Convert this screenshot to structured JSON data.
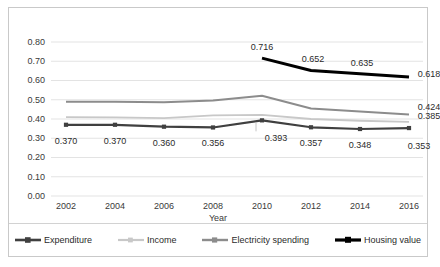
{
  "chart_data": {
    "type": "line",
    "title": "",
    "xlabel": "Year",
    "ylabel": "",
    "categories": [
      "2002",
      "2004",
      "2006",
      "2008",
      "2010",
      "2012",
      "2014",
      "2016"
    ],
    "x": [
      2002,
      2004,
      2006,
      2008,
      2010,
      2012,
      2014,
      2016
    ],
    "ylim": [
      0.0,
      0.8
    ],
    "yticks": [
      "0.00",
      "0.10",
      "0.20",
      "0.30",
      "0.40",
      "0.50",
      "0.60",
      "0.70",
      "0.80"
    ],
    "ytick_values": [
      0.0,
      0.1,
      0.2,
      0.3,
      0.4,
      0.5,
      0.6,
      0.7,
      0.8
    ],
    "grid": "horizontal",
    "legend_position": "bottom",
    "series": [
      {
        "name": "Expenditure",
        "color": "#404040",
        "marker": "square",
        "width": 2.2,
        "values": [
          0.37,
          0.37,
          0.36,
          0.356,
          0.393,
          0.357,
          0.348,
          0.353
        ],
        "labels": [
          "0.370",
          "0.370",
          "0.360",
          "0.356",
          "0.393",
          "0.357",
          "0.348",
          "0.353"
        ]
      },
      {
        "name": "Income",
        "color": "#c8c8c8",
        "marker": "none",
        "width": 1.8,
        "values": [
          0.41,
          0.408,
          0.405,
          0.419,
          0.421,
          0.4,
          0.391,
          0.385
        ],
        "labels": [
          "",
          "",
          "",
          "",
          "",
          "",
          "",
          "0.385"
        ]
      },
      {
        "name": "Electricity spending",
        "color": "#8c8c8c",
        "marker": "none",
        "width": 2.0,
        "values": [
          0.49,
          0.489,
          0.487,
          0.496,
          0.521,
          0.455,
          0.439,
          0.424
        ],
        "labels": [
          "",
          "",
          "",
          "",
          "",
          "",
          "",
          "0.424"
        ]
      },
      {
        "name": "Housing value",
        "color": "#000000",
        "marker": "none",
        "width": 3.0,
        "values": [
          null,
          null,
          null,
          null,
          0.716,
          0.652,
          0.635,
          0.618
        ],
        "labels": [
          "",
          "",
          "",
          "",
          "0.716",
          "0.652",
          "0.635",
          "0.618"
        ]
      }
    ],
    "annotations": [
      {
        "text": "0.370",
        "series": "Expenditure",
        "x": 2002,
        "y": 0.37
      },
      {
        "text": "0.370",
        "series": "Expenditure",
        "x": 2004,
        "y": 0.37
      },
      {
        "text": "0.360",
        "series": "Expenditure",
        "x": 2006,
        "y": 0.36
      },
      {
        "text": "0.356",
        "series": "Expenditure",
        "x": 2008,
        "y": 0.356
      },
      {
        "text": "0.393",
        "series": "Expenditure",
        "x": 2010,
        "y": 0.393
      },
      {
        "text": "0.357",
        "series": "Expenditure",
        "x": 2012,
        "y": 0.357
      },
      {
        "text": "0.348",
        "series": "Expenditure",
        "x": 2014,
        "y": 0.348
      },
      {
        "text": "0.353",
        "series": "Expenditure",
        "x": 2016,
        "y": 0.353
      },
      {
        "text": "0.716",
        "series": "Housing value",
        "x": 2010,
        "y": 0.716
      },
      {
        "text": "0.652",
        "series": "Housing value",
        "x": 2012,
        "y": 0.652
      },
      {
        "text": "0.635",
        "series": "Housing value",
        "x": 2014,
        "y": 0.635
      },
      {
        "text": "0.618",
        "series": "Housing value",
        "x": 2016,
        "y": 0.618
      },
      {
        "text": "0.424",
        "series": "Electricity spending",
        "x": 2016,
        "y": 0.424
      },
      {
        "text": "0.385",
        "series": "Income",
        "x": 2016,
        "y": 0.385
      }
    ]
  },
  "labels": {
    "yticks": [
      "0.80",
      "0.70",
      "0.60",
      "0.50",
      "0.40",
      "0.30",
      "0.20",
      "0.10",
      "0.00"
    ],
    "xticks": [
      "2002",
      "2004",
      "2006",
      "2008",
      "2010",
      "2012",
      "2014",
      "2016"
    ],
    "xaxis_title": "Year",
    "legend": [
      "Expenditure",
      "Income",
      "Electricity spending",
      "Housing value"
    ],
    "data_labels": {
      "expenditure": [
        "0.370",
        "0.370",
        "0.360",
        "0.356",
        "0.393",
        "0.357",
        "0.348",
        "0.353"
      ],
      "housing_value": [
        "0.716",
        "0.652",
        "0.635",
        "0.618"
      ],
      "electricity_spending_last": "0.424",
      "income_last": "0.385"
    }
  },
  "colors": {
    "expenditure": "#404040",
    "income": "#c8c8c8",
    "electricity": "#8c8c8c",
    "housing": "#000000",
    "grid": "#e3e3e3",
    "frame": "#c9c9c9",
    "text": "#3a3a3a"
  }
}
